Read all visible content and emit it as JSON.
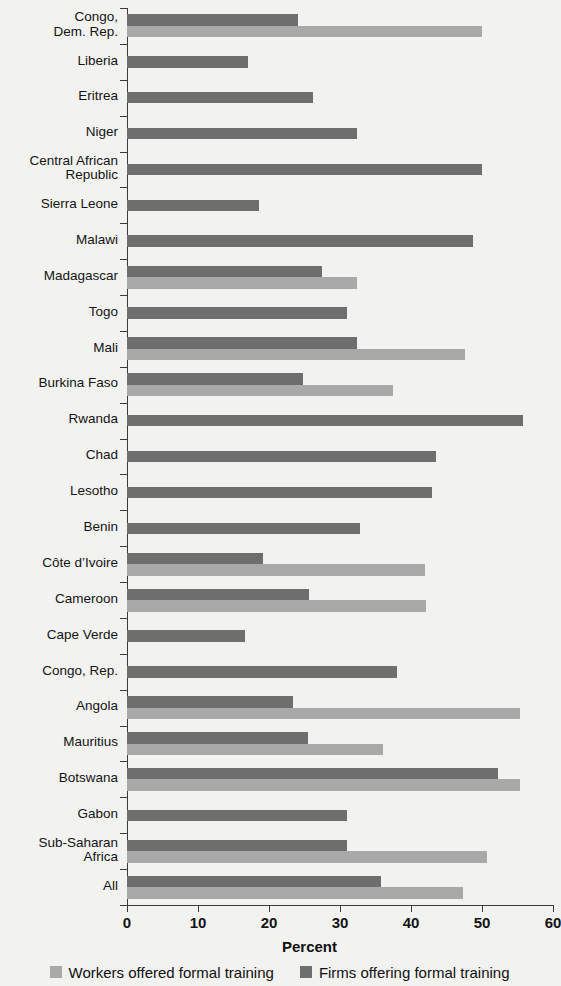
{
  "chart_data": {
    "type": "bar",
    "orientation": "horizontal",
    "title": "",
    "xlabel": "Percent",
    "ylabel": "",
    "xlim": [
      0,
      60
    ],
    "xticks": [
      0,
      10,
      20,
      30,
      40,
      50,
      60
    ],
    "grid": false,
    "legend_position": "bottom",
    "categories": [
      "Congo,\nDem. Rep.",
      "Liberia",
      "Eritrea",
      "Niger",
      "Central African\nRepublic",
      "Sierra Leone",
      "Malawi",
      "Madagascar",
      "Togo",
      "Mali",
      "Burkina Faso",
      "Rwanda",
      "Chad",
      "Lesotho",
      "Benin",
      "Côte d’Ivoire",
      "Cameroon",
      "Cape Verde",
      "Congo, Rep.",
      "Angola",
      "Mauritius",
      "Botswana",
      "Gabon",
      "Sub-Saharan\nAfrica",
      "All"
    ],
    "series": [
      {
        "name": "Firms offering formal training",
        "color": "#6e6e6e",
        "values": [
          24.1,
          17.0,
          26.2,
          32.4,
          50.0,
          18.6,
          48.7,
          27.4,
          31.0,
          32.4,
          24.8,
          55.8,
          43.5,
          43.0,
          32.8,
          19.2,
          25.6,
          16.6,
          38.0,
          23.4,
          25.5,
          52.3,
          31.0,
          31.0,
          35.8
        ]
      },
      {
        "name": "Workers offered formal training",
        "color": "#a9a9a9",
        "values": [
          50.0,
          null,
          null,
          null,
          null,
          null,
          null,
          32.4,
          null,
          47.6,
          37.5,
          null,
          null,
          null,
          null,
          42.0,
          42.1,
          null,
          null,
          55.4,
          36.1,
          55.4,
          null,
          50.7,
          47.3
        ]
      }
    ]
  },
  "legend": {
    "items": [
      {
        "label": "Workers offered formal training",
        "swatch": "workers"
      },
      {
        "label": "Firms offering formal training",
        "swatch": "firms"
      }
    ]
  },
  "axis": {
    "x_title": "Percent",
    "tick_labels": [
      "0",
      "10",
      "20",
      "30",
      "40",
      "50",
      "60"
    ]
  }
}
